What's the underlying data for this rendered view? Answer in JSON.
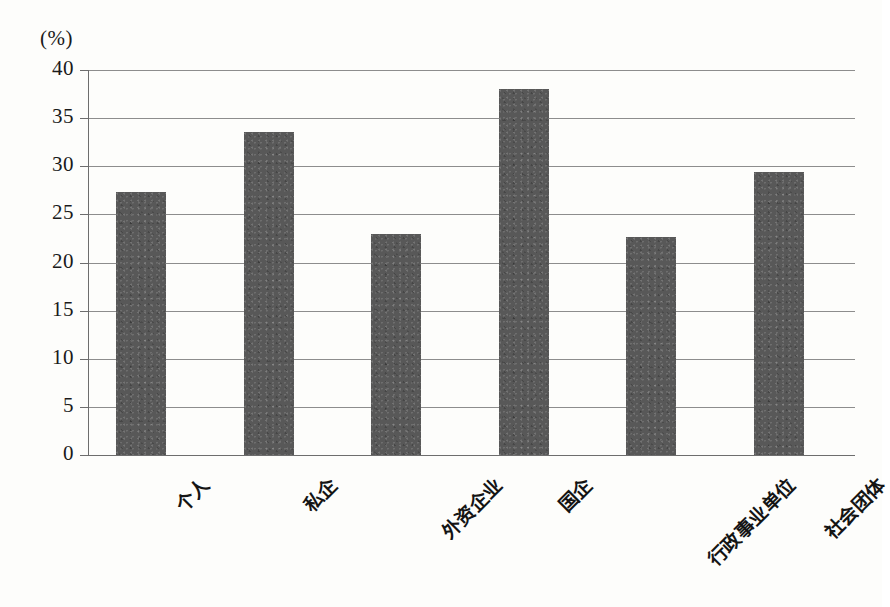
{
  "chart_data": {
    "type": "bar",
    "title": "",
    "subtitle": "",
    "xlabel": "",
    "ylabel": "(%)",
    "ylim": [
      0,
      40
    ],
    "yticks": [
      0,
      5,
      10,
      15,
      20,
      25,
      30,
      35,
      40
    ],
    "ytick_labels": [
      "0",
      "5",
      "10",
      "15",
      "20",
      "25",
      "30",
      "35",
      "40"
    ],
    "grid": true,
    "legend": false,
    "categories": [
      "个人",
      "私企",
      "外资企业",
      "国企",
      "行政事业单位",
      "社会团体"
    ],
    "values": [
      27.3,
      33.6,
      23.0,
      38.0,
      22.7,
      29.4
    ],
    "bar_color": "#585858",
    "grid_color": "#8d8d8d",
    "axis_color": "#6d6d6d",
    "background_color": "#fdfdfb",
    "xtick_rotation": -45
  }
}
